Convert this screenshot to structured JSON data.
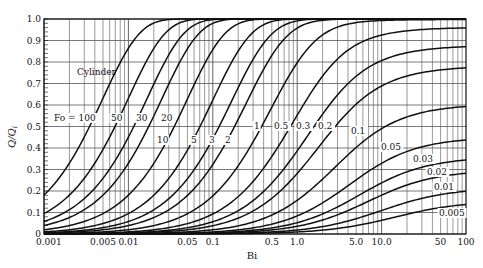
{
  "chart_data": {
    "type": "line",
    "title": "",
    "annotation": "Cylinder",
    "xlabel": "Bi",
    "ylabel": "Q/Q_i",
    "xscale": "log",
    "xlim": [
      0.001,
      100
    ],
    "ylim": [
      0,
      1.0
    ],
    "grid": true,
    "x_tick_labels": [
      "0.001",
      "0.005",
      "0.01",
      "0.05",
      "0.1",
      "0.5",
      "1.0",
      "5.0",
      "10.0",
      "50",
      "100"
    ],
    "x_ticks": [
      0.001,
      0.005,
      0.01,
      0.05,
      0.1,
      0.5,
      1.0,
      5.0,
      10.0,
      50,
      100
    ],
    "y_tick_labels": [
      "0",
      "0.1",
      "0.2",
      "0.3",
      "0.4",
      "0.5",
      "0.6",
      "0.7",
      "0.8",
      "0.9",
      "1.0"
    ],
    "y_ticks": [
      0,
      0.1,
      0.2,
      0.3,
      0.4,
      0.5,
      0.6,
      0.7,
      0.8,
      0.9,
      1.0
    ],
    "parameter_name": "Fo",
    "series": [
      {
        "name": "Fo = 100",
        "Fo": 100,
        "label": "Fo = 100",
        "start_value_at_Bi_0.001": 0.18
      },
      {
        "name": "Fo = 50",
        "Fo": 50,
        "label": "50",
        "start_value_at_Bi_0.001": 0.095
      },
      {
        "name": "Fo = 30",
        "Fo": 30,
        "label": "30",
        "start_value_at_Bi_0.001": 0.058
      },
      {
        "name": "Fo = 20",
        "Fo": 20,
        "label": "20",
        "start_value_at_Bi_0.001": 0.039
      },
      {
        "name": "Fo = 10",
        "Fo": 10,
        "label": "10",
        "start_value_at_Bi_0.001": 0.02
      },
      {
        "name": "Fo = 5",
        "Fo": 5,
        "label": "5"
      },
      {
        "name": "Fo = 3",
        "Fo": 3,
        "label": "3"
      },
      {
        "name": "Fo = 2",
        "Fo": 2,
        "label": "2"
      },
      {
        "name": "Fo = 1",
        "Fo": 1,
        "label": "1"
      },
      {
        "name": "Fo = 0.5",
        "Fo": 0.5,
        "label": "0.5",
        "value_at_Bi_100": 0.97
      },
      {
        "name": "Fo = 0.3",
        "Fo": 0.3,
        "label": "0.3",
        "value_at_Bi_100": 0.88
      },
      {
        "name": "Fo = 0.2",
        "Fo": 0.2,
        "label": "0.2",
        "value_at_Bi_100": 0.78
      },
      {
        "name": "Fo = 0.1",
        "Fo": 0.1,
        "label": "0.1",
        "value_at_Bi_100": 0.6
      },
      {
        "name": "Fo = 0.05",
        "Fo": 0.05,
        "label": "0.05",
        "value_at_Bi_100": 0.44
      },
      {
        "name": "Fo = 0.03",
        "Fo": 0.03,
        "label": "0.03",
        "value_at_Bi_100": 0.35
      },
      {
        "name": "Fo = 0.02",
        "Fo": 0.02,
        "label": "0.02",
        "value_at_Bi_100": 0.29
      },
      {
        "name": "Fo = 0.01",
        "Fo": 0.01,
        "label": "0.01",
        "value_at_Bi_100": 0.21
      },
      {
        "name": "Fo = 0.005",
        "Fo": 0.005,
        "label": "0.005",
        "value_at_Bi_100": 0.14
      }
    ]
  },
  "labels": {
    "annotation": "Cylinder",
    "xlabel": "Bi",
    "ylabel_main": "Q/Q",
    "ylabel_sub": "i"
  },
  "curve_labels": [
    {
      "text": "Fo = 100",
      "x": 54,
      "y": 121
    },
    {
      "text": "50",
      "x": 111,
      "y": 121
    },
    {
      "text": "30",
      "x": 136,
      "y": 121
    },
    {
      "text": "20",
      "x": 161,
      "y": 121
    },
    {
      "text": "10",
      "x": 157,
      "y": 143
    },
    {
      "text": "5",
      "x": 191,
      "y": 143
    },
    {
      "text": "3",
      "x": 209,
      "y": 143
    },
    {
      "text": "2",
      "x": 225,
      "y": 143
    },
    {
      "text": "1",
      "x": 254,
      "y": 129
    },
    {
      "text": "0.5",
      "x": 274,
      "y": 129
    },
    {
      "text": "0.3",
      "x": 296,
      "y": 129
    },
    {
      "text": "0.2",
      "x": 318,
      "y": 129
    },
    {
      "text": "0.1",
      "x": 351,
      "y": 134
    },
    {
      "text": "0.05",
      "x": 381,
      "y": 150
    },
    {
      "text": "0.03",
      "x": 413,
      "y": 162
    },
    {
      "text": "0.02",
      "x": 427,
      "y": 175
    },
    {
      "text": "0.01",
      "x": 434,
      "y": 190
    },
    {
      "text": "0.005",
      "x": 439,
      "y": 216
    }
  ]
}
